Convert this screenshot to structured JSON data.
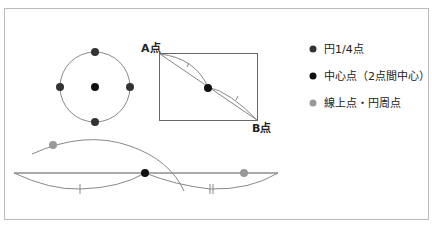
{
  "labels": {
    "a": "A点",
    "b": "B点"
  },
  "legend": [
    {
      "text": "円1/4点",
      "color": "#333333"
    },
    {
      "text": "中心点（2点間中心）",
      "color": "#111111"
    },
    {
      "text": "線上点・円周点",
      "color": "#999999"
    }
  ],
  "colors": {
    "line": "#888888",
    "border": "#bbbbbb"
  }
}
